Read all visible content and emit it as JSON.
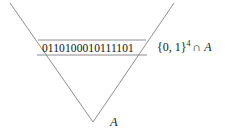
{
  "figure": {
    "background_color": "#ffffff",
    "stroke_color": "#808080",
    "text_color": "#1a1a1a",
    "triangle": {
      "name": "A",
      "label": "A",
      "apex": {
        "x": 93,
        "y": 122
      },
      "top_left": {
        "x": 10,
        "y": 3
      },
      "top_right": {
        "x": 174,
        "y": 3
      }
    },
    "band": {
      "top_y": 40,
      "bottom_y": 55,
      "left_x": 37,
      "right_x": 147
    },
    "binary_string": "0110100010111101",
    "set_label": {
      "base": "{0, 1}",
      "exponent": "4",
      "operator": "∩",
      "set_name": "A"
    }
  }
}
